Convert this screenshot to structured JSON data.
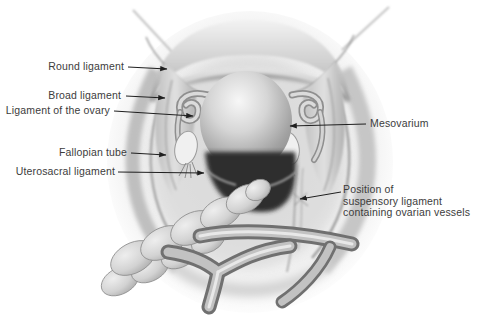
{
  "labels": {
    "round_ligament": "Round ligament",
    "broad_ligament": "Broad ligament",
    "ligament_of_the_ovary": "Ligament of the ovary",
    "fallopian_tube": "Fallopian tube",
    "uterosacral_ligament": "Uterosacral ligament",
    "mesovarium": "Mesovarium",
    "suspensory_ligament": "Position of\nsuspensory ligament\ncontaining ovarian vessels"
  },
  "colors": {
    "background": "#ffffff",
    "label_text": "#3c3c3c",
    "leader_line": "#1f1f1f",
    "illustration_dark_shadow": "#2e2e2e",
    "illustration_mid_gray": "#b5b5b5",
    "illustration_light_gray": "#e8e8e8"
  }
}
